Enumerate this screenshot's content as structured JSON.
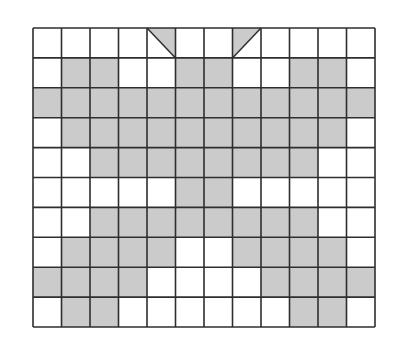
{
  "diagram": {
    "type": "grid-pattern",
    "rows": 10,
    "cols": 12,
    "origin": [
      33,
      28
    ],
    "cell_width": 28.5,
    "cell_height": 29.9,
    "colors": {
      "fill": "#cbcbcb",
      "empty": "#ffffff",
      "line": "#2e2e2e"
    },
    "cells": [
      [
        0,
        0,
        0,
        0,
        "TR",
        0,
        0,
        "TL",
        0,
        0,
        0,
        0
      ],
      [
        0,
        1,
        1,
        0,
        0,
        1,
        1,
        0,
        0,
        1,
        1,
        0
      ],
      [
        1,
        1,
        1,
        1,
        1,
        1,
        1,
        1,
        1,
        1,
        1,
        1
      ],
      [
        0,
        1,
        1,
        1,
        1,
        1,
        1,
        1,
        1,
        1,
        1,
        0
      ],
      [
        0,
        0,
        1,
        1,
        1,
        1,
        1,
        1,
        1,
        1,
        0,
        0
      ],
      [
        0,
        0,
        0,
        0,
        0,
        1,
        1,
        0,
        0,
        0,
        0,
        0
      ],
      [
        0,
        0,
        1,
        1,
        1,
        1,
        1,
        1,
        1,
        1,
        0,
        0
      ],
      [
        0,
        1,
        1,
        1,
        1,
        0,
        0,
        1,
        1,
        1,
        1,
        0
      ],
      [
        1,
        1,
        1,
        1,
        0,
        0,
        0,
        0,
        1,
        1,
        1,
        1
      ],
      [
        0,
        1,
        1,
        0,
        0,
        0,
        0,
        0,
        0,
        1,
        1,
        0
      ]
    ],
    "legend": {
      "1": "shaded cell",
      "0": "empty cell",
      "TR": "half-shaded cell, upper-right triangle",
      "TL": "half-shaded cell, upper-left triangle"
    }
  }
}
